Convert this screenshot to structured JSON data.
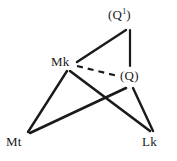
{
  "diagram": {
    "type": "graph",
    "background_color": "#ffffff",
    "line_color": "#1a1a1a",
    "text_color": "#1a1a1a",
    "width": 177,
    "height": 161,
    "nodes": [
      {
        "id": "q1",
        "label_prefix": "(Q",
        "label_sup": "1",
        "label_suffix": ")",
        "label": "(Q¹)",
        "x": 130,
        "y": 16
      },
      {
        "id": "mk",
        "label_prefix": "Mk",
        "label_sup": "",
        "label_suffix": "",
        "label": "Mk",
        "x": 62,
        "y": 62
      },
      {
        "id": "q",
        "label_prefix": "(Q",
        "label_sup": "",
        "label_suffix": ")",
        "label": "(Q)",
        "x": 131,
        "y": 76
      },
      {
        "id": "mt",
        "label_prefix": "Mt",
        "label_sup": "",
        "label_suffix": "",
        "label": "Mt",
        "x": 17,
        "y": 142
      },
      {
        "id": "lk",
        "label_prefix": "Lk",
        "label_sup": "",
        "label_suffix": "",
        "label": "Lk",
        "x": 152,
        "y": 142
      }
    ],
    "edges": [
      {
        "id": "mk-q1",
        "from": "Mk",
        "to": "(Q¹)",
        "style": "solid",
        "x1": 77,
        "y1": 62,
        "x2": 126,
        "y2": 30
      },
      {
        "id": "q1-q",
        "from": "(Q¹)",
        "to": "(Q)",
        "style": "solid",
        "x1": 130,
        "y1": 30,
        "x2": 130,
        "y2": 66
      },
      {
        "id": "mk-q",
        "from": "Mk",
        "to": "(Q)",
        "style": "dashed",
        "x1": 77,
        "y1": 66,
        "x2": 118,
        "y2": 76
      },
      {
        "id": "mk-mt",
        "from": "Mk",
        "to": "Mt",
        "style": "solid",
        "x1": 67,
        "y1": 71,
        "x2": 28,
        "y2": 132
      },
      {
        "id": "mk-lk",
        "from": "Mk",
        "to": "Lk",
        "style": "solid",
        "x1": 70,
        "y1": 71,
        "x2": 150,
        "y2": 131
      },
      {
        "id": "mt-q",
        "from": "Mt",
        "to": "(Q)",
        "style": "solid",
        "x1": 30,
        "y1": 133,
        "x2": 126,
        "y2": 88
      },
      {
        "id": "q-lk",
        "from": "(Q)",
        "to": "Lk",
        "style": "solid",
        "x1": 133,
        "y1": 88,
        "x2": 153,
        "y2": 131
      }
    ]
  }
}
